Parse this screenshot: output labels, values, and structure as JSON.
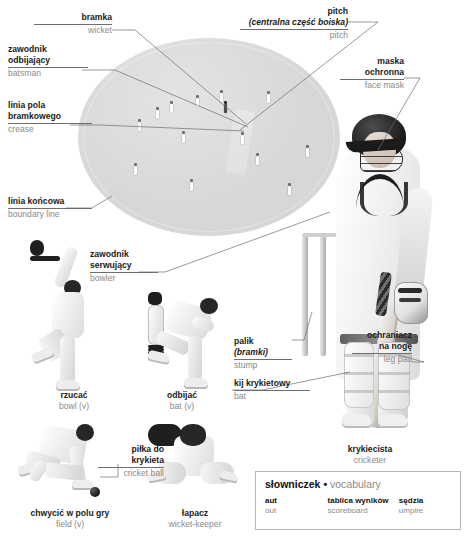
{
  "page": {
    "background_color": "#ffffff",
    "field_color": "#d7d7d7",
    "en_label_color": "#8a8a8a",
    "pl_label_color": "#1a1a1a"
  },
  "callouts": [
    {
      "id": "wicket",
      "pl": "bramka",
      "pl_sub": "",
      "en": "wicket",
      "align": "right"
    },
    {
      "id": "batsman",
      "pl_line1": "zawodnik",
      "pl_line2": "odbijający",
      "en": "batsman",
      "align": "left"
    },
    {
      "id": "crease",
      "pl_line1": "linia pola",
      "pl_line2": "bramkowego",
      "en": "crease",
      "align": "left"
    },
    {
      "id": "boundary",
      "pl": "linia końcowa",
      "pl_sub": "",
      "en": "boundary line",
      "align": "left"
    },
    {
      "id": "bowler",
      "pl_line1": "zawodnik",
      "pl_line2": "serwujący",
      "en": "bowler",
      "align": "left"
    },
    {
      "id": "pitch",
      "pl": "pitch",
      "pl_sub": "(centralna część boiska)",
      "en": "pitch",
      "align": "right"
    },
    {
      "id": "facemask",
      "pl_line1": "maska",
      "pl_line2": "ochronna",
      "en": "face mask",
      "align": "right"
    },
    {
      "id": "legpad",
      "pl_line1": "ochraniacz",
      "pl_line2": "na nogę",
      "en": "leg pad",
      "align": "right"
    },
    {
      "id": "stump",
      "pl": "palik",
      "pl_sub": "(bramki)",
      "en": "stump",
      "align": "left"
    },
    {
      "id": "bat",
      "pl": "kij krykietowy",
      "pl_sub": "",
      "en": "bat",
      "align": "left"
    },
    {
      "id": "ball",
      "pl_line1": "piłka do",
      "pl_line2": "krykieta",
      "en": "cricket ball",
      "align": "right"
    }
  ],
  "captions": [
    {
      "id": "bowl",
      "pl": "rzucać",
      "en": "bowl (v)"
    },
    {
      "id": "bat-v",
      "pl": "odbijać",
      "en": "bat (v)"
    },
    {
      "id": "field-v",
      "pl": "chwycić w polu gry",
      "en": "field (v)"
    },
    {
      "id": "wicketkeeper",
      "pl": "łapacz",
      "en": "wicket-keeper"
    },
    {
      "id": "cricketer",
      "pl": "krykiecista",
      "en": "cricketer"
    }
  ],
  "vocabulary": {
    "title_pl": "słowniczek",
    "title_sep": "•",
    "title_en": "vocabulary",
    "entries": [
      {
        "pl": "aut",
        "en": "out"
      },
      {
        "pl": "tablica wyników",
        "en": "scoreboard"
      },
      {
        "pl": "sędzia",
        "en": "umpire"
      }
    ]
  }
}
